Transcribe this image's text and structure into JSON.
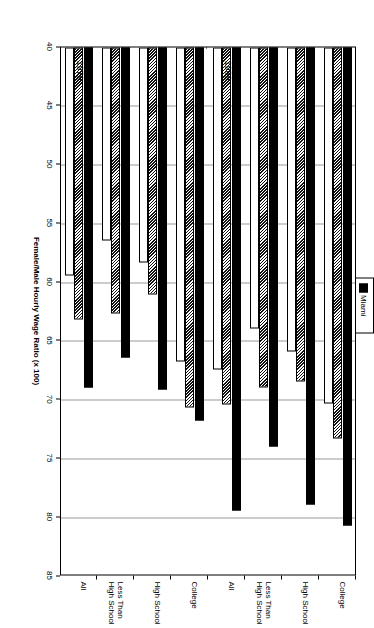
{
  "chart_data": {
    "type": "bar",
    "orientation": "horizontal",
    "title": "",
    "xlabel": "Female/Male Hourly Wage Ratio (x 100)",
    "ylabel": "",
    "xlim": [
      40,
      85
    ],
    "xticks": [
      "40",
      "45",
      "50",
      "55",
      "60",
      "65",
      "70",
      "75",
      "80",
      "85"
    ],
    "grid": true,
    "legend_position": "top",
    "legend": [
      "Miami",
      "U.S.",
      "St. Louis"
    ],
    "panels": [
      {
        "label": "1979",
        "categories": [
          "All",
          "Less Than\nHigh School",
          "High School",
          "College"
        ],
        "series": [
          {
            "name": "Miami",
            "values": [
              68.9,
              66.4,
              69.1,
              71.7
            ]
          },
          {
            "name": "U.S.",
            "values": [
              63.1,
              62.6,
              61.0,
              70.6
            ]
          },
          {
            "name": "St. Louis",
            "values": [
              59.4,
              56.4,
              58.3,
              66.7
            ]
          }
        ]
      },
      {
        "label": "1989",
        "categories": [
          "All",
          "Less Than\nHigh School",
          "High School",
          "College"
        ],
        "series": [
          {
            "name": "Miami",
            "values": [
              79.4,
              73.9,
              78.9,
              80.7
            ]
          },
          {
            "name": "U.S.",
            "values": [
              70.4,
              68.9,
              68.4,
              73.3
            ]
          },
          {
            "name": "St. Louis",
            "values": [
              67.4,
              63.9,
              65.9,
              70.3
            ]
          }
        ]
      }
    ]
  },
  "legend": {
    "items": [
      {
        "label": "Miami",
        "style": "solid-black"
      },
      {
        "label": "U.S.",
        "style": "hatched"
      },
      {
        "label": "St. Louis",
        "style": "white"
      }
    ]
  },
  "axis": {
    "title": "Female/Male Hourly Wage Ratio (x 100)",
    "ticks": [
      "85",
      "80",
      "75",
      "70",
      "65",
      "60",
      "55",
      "50",
      "45",
      "40"
    ]
  },
  "panels": {
    "first": {
      "label": "1989"
    },
    "second": {
      "label": "1979"
    }
  },
  "categories": [
    {
      "label": "All"
    },
    {
      "label": "Less Than\nHigh School"
    },
    {
      "label": "High School"
    },
    {
      "label": "College"
    }
  ],
  "colors": {
    "miami": "#000000",
    "us": "#333333",
    "st_louis": "#ffffff",
    "grid": "#9a9a9a",
    "frame": "#000000",
    "background": "#ffffff"
  }
}
